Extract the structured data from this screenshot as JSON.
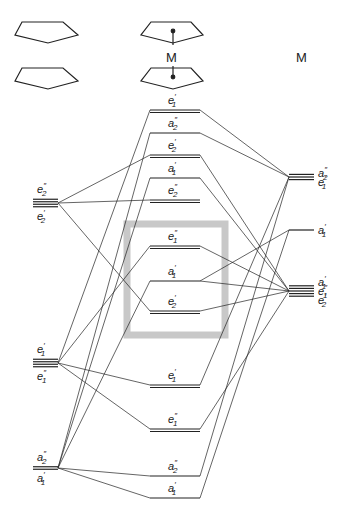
{
  "columns": {
    "left": {
      "label": "ligand orbitals (2 Cp)",
      "icon": "two-cyclopentadienyl-rings-icon"
    },
    "center": {
      "label": "complex",
      "icon": "metallocene-sandwich-icon",
      "metal_label": "M"
    },
    "right": {
      "label": "M"
    }
  },
  "colors": {
    "line": "#222222",
    "highlight_box": "#c8c8c8"
  },
  "left_levels": [
    {
      "id": "L_e2",
      "labels": [
        "e″2",
        "e′2"
      ],
      "sym_top": "e",
      "sup_top": "″",
      "sub_top": "2",
      "sym_bot": "e",
      "sup_bot": "′",
      "sub_bot": "2",
      "y": 203,
      "lines": 4
    },
    {
      "id": "L_e1",
      "labels": [
        "e′1",
        "e″1"
      ],
      "sym_top": "e",
      "sup_top": "′",
      "sub_top": "1",
      "sym_bot": "e",
      "sup_bot": "″",
      "sub_bot": "1",
      "y": 363,
      "lines": 4
    },
    {
      "id": "L_a",
      "labels": [
        "a″2",
        "a′1"
      ],
      "sym_top": "a",
      "sup_top": "″",
      "sub_top": "2",
      "sym_bot": "a",
      "sup_bot": "′",
      "sub_bot": "1",
      "y": 468,
      "lines": 2
    }
  ],
  "center_levels": [
    {
      "id": "C1",
      "sym": "e",
      "sup": "′",
      "sub": "1",
      "y": 110,
      "double": true
    },
    {
      "id": "C2",
      "sym": "a",
      "sup": "″",
      "sub": "2",
      "y": 133,
      "double": false
    },
    {
      "id": "C3",
      "sym": "e",
      "sup": "′",
      "sub": "2",
      "y": 155,
      "double": true
    },
    {
      "id": "C4",
      "sym": "a",
      "sup": "′",
      "sub": "1",
      "y": 178,
      "double": false
    },
    {
      "id": "C5",
      "sym": "e",
      "sup": "″",
      "sub": "2",
      "y": 200,
      "double": true
    },
    {
      "id": "C6",
      "sym": "e",
      "sup": "″",
      "sub": "1",
      "y": 246,
      "double": true
    },
    {
      "id": "C7",
      "sym": "a",
      "sup": "′",
      "sub": "1",
      "y": 281,
      "double": false
    },
    {
      "id": "C8",
      "sym": "e",
      "sup": "′",
      "sub": "2",
      "y": 311,
      "double": true
    },
    {
      "id": "C9",
      "sym": "e",
      "sup": "′",
      "sub": "1",
      "y": 385,
      "double": true
    },
    {
      "id": "C10",
      "sym": "e",
      "sup": "″",
      "sub": "1",
      "y": 429,
      "double": true
    },
    {
      "id": "C11",
      "sym": "a",
      "sup": "″",
      "sub": "2",
      "y": 476,
      "double": false
    },
    {
      "id": "C12",
      "sym": "a",
      "sup": "′",
      "sub": "1",
      "y": 498,
      "double": false
    }
  ],
  "right_levels": [
    {
      "id": "R_p",
      "labels": [
        "a″2",
        "e′1"
      ],
      "y": 177,
      "lines": 3
    },
    {
      "id": "R_s",
      "labels": [
        "a′1"
      ],
      "y": 230,
      "lines": 1
    },
    {
      "id": "R_d",
      "labels": [
        "a′1",
        "e″1",
        "e′2"
      ],
      "y": 291,
      "lines": 5
    }
  ],
  "highlight_box": {
    "x": 127,
    "y": 224,
    "width": 98,
    "height": 111,
    "note": "frontier d-orbital region"
  },
  "connections": [
    [
      "L_e2",
      "C3"
    ],
    [
      "L_e2",
      "C5"
    ],
    [
      "L_e2",
      "C8"
    ],
    [
      "L_e1",
      "C1"
    ],
    [
      "L_e1",
      "C6"
    ],
    [
      "L_e1",
      "C9"
    ],
    [
      "L_e1",
      "C10"
    ],
    [
      "L_a",
      "C2"
    ],
    [
      "L_a",
      "C4"
    ],
    [
      "L_a",
      "C7"
    ],
    [
      "L_a",
      "C11"
    ],
    [
      "L_a",
      "C12"
    ],
    [
      "R_p",
      "C1"
    ],
    [
      "R_p",
      "C2"
    ],
    [
      "R_p",
      "C9"
    ],
    [
      "R_p",
      "C11"
    ],
    [
      "R_s",
      "C7"
    ],
    [
      "R_s",
      "C12"
    ],
    [
      "R_d",
      "C3"
    ],
    [
      "R_d",
      "C4"
    ],
    [
      "R_d",
      "C6"
    ],
    [
      "R_d",
      "C7"
    ],
    [
      "R_d",
      "C8"
    ],
    [
      "R_d",
      "C10"
    ]
  ]
}
